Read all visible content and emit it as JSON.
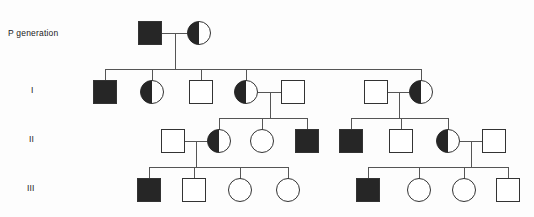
{
  "figure": {
    "kind": "pedigree-chart",
    "width": 534,
    "height": 217,
    "background": "#fdfdfd",
    "line_color": "#555555",
    "symbol_stroke": "#333333",
    "affected_fill": "#262626",
    "unaffected_fill": "#ffffff"
  },
  "labels": {
    "p_generation": "P generation",
    "gen_1": "I",
    "gen_2": "II",
    "gen_3": "III"
  },
  "legend_semantics": {
    "square": "male",
    "circle": "female",
    "filled": "affected",
    "half_filled": "carrier / heterozygote",
    "empty": "unaffected"
  },
  "chart_data": {
    "type": "pedigree",
    "generations": [
      {
        "id": "P",
        "label": "P generation",
        "y": 33,
        "individuals": [
          {
            "id": "P-1",
            "shape": "square",
            "fill": "filled",
            "x": 150,
            "y": 33,
            "size": 23
          },
          {
            "id": "P-2",
            "shape": "circle",
            "fill": "half-filled",
            "x": 199,
            "y": 33,
            "size": 23
          }
        ]
      },
      {
        "id": "I",
        "label": "I",
        "y": 92,
        "individuals": [
          {
            "id": "I-1",
            "shape": "square",
            "fill": "filled",
            "x": 105,
            "y": 92,
            "size": 23
          },
          {
            "id": "I-2",
            "shape": "circle",
            "fill": "half-filled",
            "x": 152,
            "y": 92,
            "size": 23
          },
          {
            "id": "I-3",
            "shape": "square",
            "fill": "empty",
            "x": 201,
            "y": 92,
            "size": 23
          },
          {
            "id": "I-4",
            "shape": "circle",
            "fill": "half-filled",
            "x": 246,
            "y": 92,
            "size": 23
          },
          {
            "id": "I-5",
            "shape": "square",
            "fill": "empty",
            "x": 293,
            "y": 92,
            "size": 23
          },
          {
            "id": "I-6",
            "shape": "square",
            "fill": "empty",
            "x": 376,
            "y": 92,
            "size": 23
          },
          {
            "id": "I-7",
            "shape": "circle",
            "fill": "half-filled",
            "x": 421,
            "y": 92,
            "size": 23
          }
        ]
      },
      {
        "id": "II",
        "label": "II",
        "y": 141,
        "individuals": [
          {
            "id": "II-1",
            "shape": "square",
            "fill": "empty",
            "x": 173,
            "y": 141,
            "size": 23
          },
          {
            "id": "II-2",
            "shape": "circle",
            "fill": "half-filled",
            "x": 219,
            "y": 141,
            "size": 23
          },
          {
            "id": "II-3",
            "shape": "circle",
            "fill": "empty",
            "x": 262,
            "y": 141,
            "size": 23
          },
          {
            "id": "II-4",
            "shape": "square",
            "fill": "filled",
            "x": 307,
            "y": 141,
            "size": 23
          },
          {
            "id": "II-5",
            "shape": "square",
            "fill": "filled",
            "x": 351,
            "y": 141,
            "size": 23
          },
          {
            "id": "II-6",
            "shape": "square",
            "fill": "empty",
            "x": 401,
            "y": 141,
            "size": 23
          },
          {
            "id": "II-7",
            "shape": "circle",
            "fill": "half-filled",
            "x": 448,
            "y": 141,
            "size": 23
          },
          {
            "id": "II-8",
            "shape": "square",
            "fill": "empty",
            "x": 494,
            "y": 141,
            "size": 23
          }
        ]
      },
      {
        "id": "III",
        "label": "III",
        "y": 190,
        "individuals": [
          {
            "id": "III-1",
            "shape": "square",
            "fill": "filled",
            "x": 149,
            "y": 190,
            "size": 23
          },
          {
            "id": "III-2",
            "shape": "square",
            "fill": "empty",
            "x": 194,
            "y": 190,
            "size": 23
          },
          {
            "id": "III-3",
            "shape": "circle",
            "fill": "empty",
            "x": 240,
            "y": 190,
            "size": 23
          },
          {
            "id": "III-4",
            "shape": "circle",
            "fill": "empty",
            "x": 288,
            "y": 190,
            "size": 23
          },
          {
            "id": "III-5",
            "shape": "square",
            "fill": "filled",
            "x": 368,
            "y": 190,
            "size": 23
          },
          {
            "id": "III-6",
            "shape": "circle",
            "fill": "empty",
            "x": 419,
            "y": 190,
            "size": 23
          },
          {
            "id": "III-7",
            "shape": "circle",
            "fill": "empty",
            "x": 464,
            "y": 190,
            "size": 23
          },
          {
            "id": "III-8",
            "shape": "square",
            "fill": "empty",
            "x": 508,
            "y": 190,
            "size": 23
          }
        ]
      }
    ],
    "matings": [
      {
        "id": "mate-P",
        "partners": [
          "P-1",
          "P-2"
        ],
        "x1": 162,
        "x2": 188,
        "y": 33,
        "drop_x": 175,
        "drop_to": 69
      },
      {
        "id": "mate-I-45",
        "partners": [
          "I-4",
          "I-5"
        ],
        "x1": 258,
        "x2": 282,
        "y": 92,
        "drop_x": 270,
        "drop_to": 118
      },
      {
        "id": "mate-I-67",
        "partners": [
          "I-6",
          "I-7"
        ],
        "x1": 388,
        "x2": 410,
        "y": 92,
        "drop_x": 399,
        "drop_to": 118
      },
      {
        "id": "mate-II-12",
        "partners": [
          "II-1",
          "II-2"
        ],
        "x1": 185,
        "x2": 208,
        "y": 141,
        "drop_x": 196,
        "drop_to": 167
      },
      {
        "id": "mate-II-78",
        "partners": [
          "II-7",
          "II-8"
        ],
        "x1": 460,
        "x2": 483,
        "y": 141,
        "drop_x": 471,
        "drop_to": 167
      }
    ],
    "sibships": [
      {
        "id": "sibship-I",
        "parents": "mate-P",
        "sib_line_y": 69,
        "x_start": 105,
        "x_end": 421,
        "children": [
          "I-1",
          "I-2",
          "I-3",
          "I-4",
          "I-7"
        ]
      },
      {
        "id": "sibship-II-left",
        "parents": "mate-I-45",
        "sib_line_y": 118,
        "x_start": 219,
        "x_end": 307,
        "children": [
          "II-2",
          "II-3",
          "II-4"
        ]
      },
      {
        "id": "sibship-II-right",
        "parents": "mate-I-67",
        "sib_line_y": 118,
        "x_start": 351,
        "x_end": 448,
        "children": [
          "II-5",
          "II-6",
          "II-7"
        ]
      },
      {
        "id": "sibship-III-left",
        "parents": "mate-II-12",
        "sib_line_y": 167,
        "x_start": 149,
        "x_end": 288,
        "children": [
          "III-1",
          "III-2",
          "III-3",
          "III-4"
        ]
      },
      {
        "id": "sibship-III-right",
        "parents": "mate-II-78",
        "sib_line_y": 167,
        "x_start": 368,
        "x_end": 508,
        "children": [
          "III-5",
          "III-6",
          "III-7",
          "III-8"
        ]
      }
    ]
  }
}
